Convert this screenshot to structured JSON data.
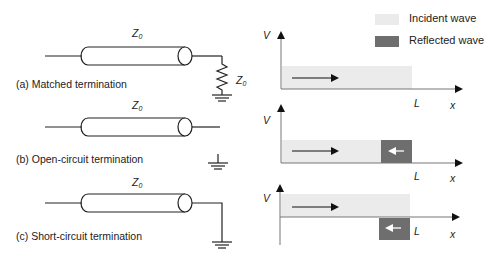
{
  "legend": {
    "incident_label": "Incident wave",
    "reflected_label": "Reflected wave",
    "incident_color": "#ebebeb",
    "reflected_color": "#6e6e6e"
  },
  "circuits": [
    {
      "caption": "(a) Matched termination",
      "line_impedance": "Z",
      "line_impedance_sub": "0",
      "load_label": "Z",
      "load_label_sub": "0",
      "termination": "resistor"
    },
    {
      "caption": "(b) Open-circuit termination",
      "line_impedance": "Z",
      "line_impedance_sub": "0",
      "termination": "open"
    },
    {
      "caption": "(c) Short-circuit termination",
      "line_impedance": "Z",
      "line_impedance_sub": "0",
      "termination": "short"
    }
  ],
  "plots": [
    {
      "y_label": "V",
      "x_label": "x",
      "length_label": "L",
      "incident": "forward",
      "reflected": "none"
    },
    {
      "y_label": "V",
      "x_label": "x",
      "length_label": "L",
      "incident": "forward",
      "reflected": "positive (in phase)"
    },
    {
      "y_label": "V",
      "x_label": "x",
      "length_label": "L",
      "incident": "forward",
      "reflected": "negative (inverted)"
    }
  ]
}
